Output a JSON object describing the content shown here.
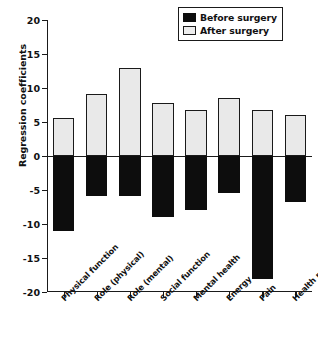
{
  "chart_data": {
    "type": "bar",
    "title": "",
    "xlabel": "",
    "ylabel": "Regression coefficients",
    "ylim": [
      -20,
      20
    ],
    "yticks": [
      20,
      15,
      10,
      5,
      0,
      -5,
      -10,
      -15,
      -20
    ],
    "ytick_labels": [
      "20",
      "15",
      "10",
      "5",
      "0",
      "-5",
      "-10",
      "-15",
      "-20"
    ],
    "grid": false,
    "legend_position": "top-right",
    "categories": [
      "Physical function",
      "Role (physical)",
      "Role (mental)",
      "Social function",
      "Mental health",
      "Energy",
      "Pain",
      "Health perception"
    ],
    "series": [
      {
        "name": "Before surgery",
        "color": "#0d0d0d",
        "values": [
          -11.1,
          -5.9,
          -5.9,
          -9.0,
          -8.0,
          -5.4,
          -18.1,
          -6.8
        ]
      },
      {
        "name": "After surgery",
        "color": "#e9e9e9",
        "values": [
          5.6,
          9.1,
          13.0,
          7.8,
          6.7,
          8.6,
          6.8,
          6.1
        ]
      }
    ]
  },
  "legend": {
    "items": [
      {
        "label": "Before surgery",
        "swatch": "before"
      },
      {
        "label": "After surgery",
        "swatch": "after"
      }
    ]
  }
}
